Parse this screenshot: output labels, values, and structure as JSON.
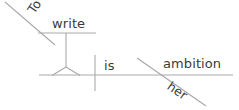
{
  "diagram": {
    "type": "reed-kellogg-sentence-diagram",
    "sentence": "To write is her ambition",
    "canvas": {
      "width": 239,
      "height": 110,
      "background": "#ffffff"
    },
    "stroke_color": "#a9a9a9",
    "text_color": "#3a3a3a",
    "words": {
      "to": "To",
      "write": "write",
      "is": "is",
      "her": "her",
      "ambition": "ambition"
    },
    "parts": {
      "infinitive_preposition": "To",
      "infinitive_verb": "write",
      "linking_verb": "is",
      "possessive_modifier": "her",
      "subject_complement": "ambition"
    },
    "strokes": [
      {
        "name": "infinitive-baseline",
        "x1": 38,
        "y1": 33,
        "x2": 96,
        "y2": 33
      },
      {
        "name": "infinitive-slant",
        "x1": 5,
        "y1": 2,
        "x2": 55,
        "y2": 45
      },
      {
        "name": "pedestal-stem",
        "x1": 66,
        "y1": 33,
        "x2": 66,
        "y2": 67
      },
      {
        "name": "pedestal-left-leg",
        "x1": 66,
        "y1": 67,
        "x2": 52,
        "y2": 76
      },
      {
        "name": "pedestal-right-leg",
        "x1": 66,
        "y1": 67,
        "x2": 80,
        "y2": 76
      },
      {
        "name": "main-baseline",
        "x1": 39,
        "y1": 75,
        "x2": 233,
        "y2": 75
      },
      {
        "name": "subject-verb-divider",
        "x1": 95,
        "y1": 55,
        "x2": 95,
        "y2": 91
      },
      {
        "name": "complement-slant",
        "x1": 137,
        "y1": 58,
        "x2": 206,
        "y2": 106
      }
    ]
  }
}
